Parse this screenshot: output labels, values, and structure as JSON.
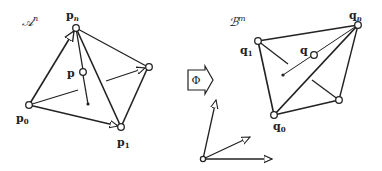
{
  "left_simplex": {
    "space_label": "𝒜",
    "space_sup": "n",
    "vertices": {
      "p_n": {
        "label": "p",
        "sub": "n"
      },
      "p_0": {
        "label": "p",
        "sub": "0"
      },
      "p_1": {
        "label": "p",
        "sub": "1"
      },
      "p": {
        "label": "p",
        "sub": ""
      }
    }
  },
  "map": {
    "label": "Φ"
  },
  "right_simplex": {
    "space_label": "ℬ",
    "space_sup": "m",
    "vertices": {
      "q_n": {
        "label": "q",
        "sub": "n"
      },
      "q_1": {
        "label": "q",
        "sub": "1"
      },
      "q_0": {
        "label": "q",
        "sub": "0"
      },
      "q": {
        "label": "q",
        "sub": ""
      }
    }
  },
  "colors": {
    "stroke": "#222222",
    "background": "#ffffff"
  }
}
